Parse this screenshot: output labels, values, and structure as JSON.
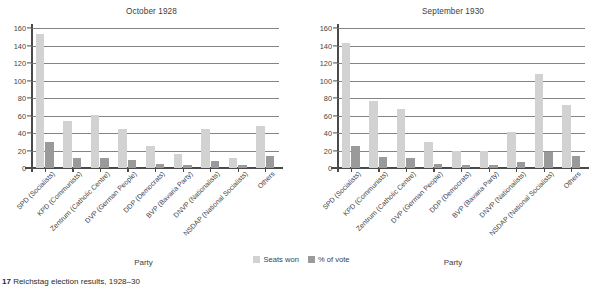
{
  "figure": {
    "caption_number": "17",
    "caption_text": "Reichstag election results, 1928–30"
  },
  "legend": {
    "seats_label": "Seats won",
    "votes_label": "% of vote",
    "seats_color": "#d2d2d2",
    "votes_color": "#9a9a9a"
  },
  "axis": {
    "xlabel": "Party",
    "yticks": [
      "0",
      "20",
      "40",
      "60",
      "80",
      "100",
      "120",
      "140",
      "160"
    ]
  },
  "chart_data": [
    {
      "type": "bar",
      "title": "October 1928",
      "xlabel": "Party",
      "ylabel": "",
      "ylim": [
        0,
        160
      ],
      "grid": true,
      "legend_position": "bottom-center",
      "categories": [
        "SPD (Socialists)",
        "KPD (Communists)",
        "Zentrum (Catholic Centre)",
        "DVP (German People)",
        "DDP (Democrats)",
        "BVP (Bavaria Party)",
        "DNVP (Nationalists)",
        "NSDAP (National Socialists)",
        "Others"
      ],
      "series": [
        {
          "name": "Seats won",
          "values": [
            153,
            54,
            61,
            45,
            25,
            16,
            45,
            12,
            48
          ]
        },
        {
          "name": "% of vote",
          "values": [
            30,
            11,
            12,
            9,
            5,
            3,
            8,
            3,
            14
          ]
        }
      ]
    },
    {
      "type": "bar",
      "title": "September 1930",
      "xlabel": "Party",
      "ylabel": "",
      "ylim": [
        0,
        160
      ],
      "grid": true,
      "legend_position": "bottom-center",
      "categories": [
        "SPD (Socialists)",
        "KPD (Communists)",
        "Zentrum (Catholic Centre)",
        "DVP (German People)",
        "DDP (Democrats)",
        "BVP (Bavaria Party)",
        "DNVP (Nationalists)",
        "NSDAP (National Socialists)",
        "Others"
      ],
      "series": [
        {
          "name": "Seats won",
          "values": [
            143,
            77,
            68,
            30,
            20,
            19,
            41,
            107,
            72
          ]
        },
        {
          "name": "% of vote",
          "values": [
            25,
            13,
            12,
            5,
            4,
            3,
            7,
            18,
            14
          ]
        }
      ]
    }
  ]
}
